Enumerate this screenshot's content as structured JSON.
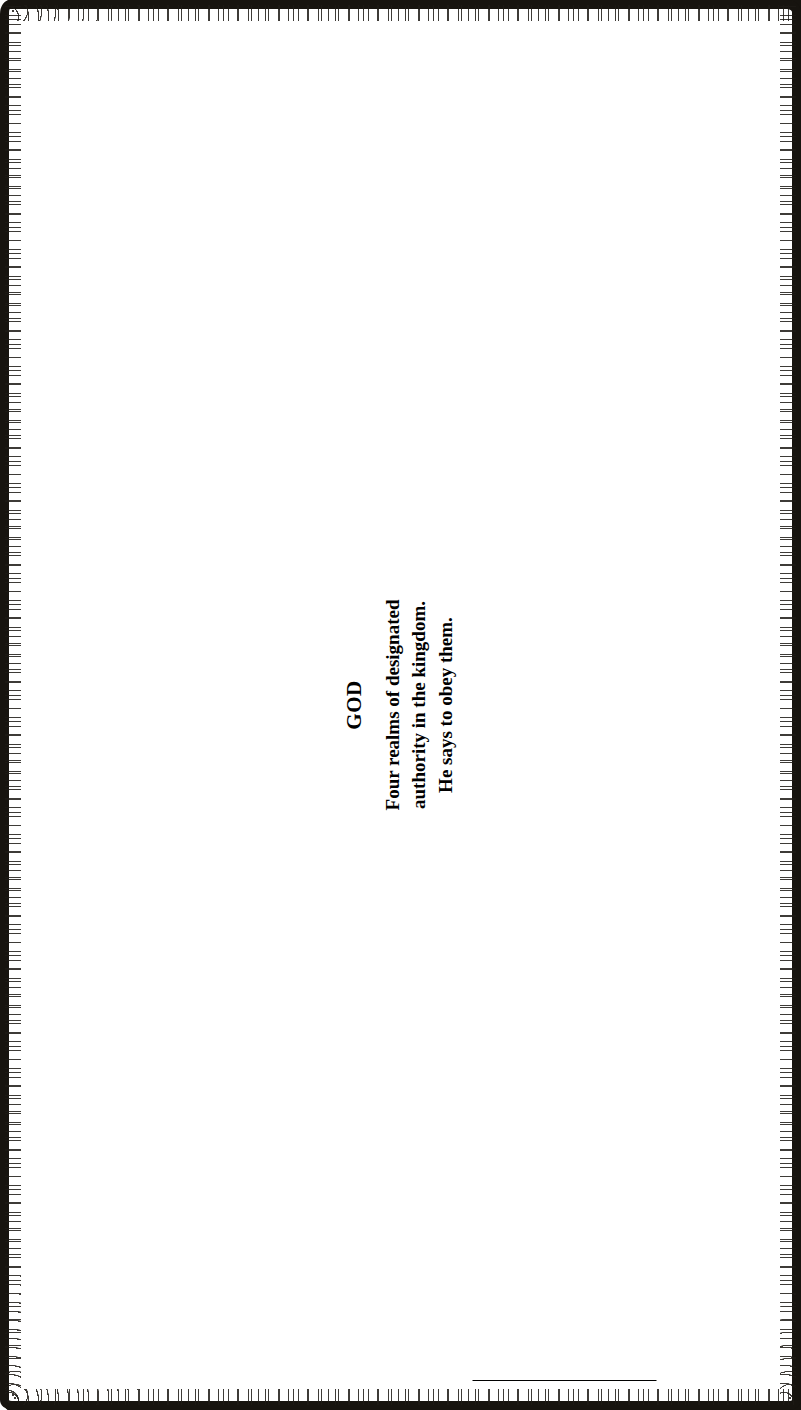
{
  "diagram": {
    "title": "Four Realms of Designated Authority",
    "orientation": "rotated-90-ccw",
    "source_type": "scanned book illustration",
    "ink_color": "#000000",
    "paper_color": "#ffffff"
  },
  "tablet": {
    "heading": "GOD",
    "lines": [
      "Four realms of designated",
      "authority in the kingdom.",
      "He says to obey them."
    ]
  },
  "notes": {
    "acts": [
      "Acts 5:29 — Peter and",
      "other apostles replied,",
      "“We must obey God",
      "rather than men.”"
    ],
    "conflict": [
      "None of these conflict",
      "when you are under the",
      "right head."
    ]
  },
  "realms": [
    {
      "id": "civil",
      "label_head": "CIVIL",
      "label_sub": "Judges — Kings — President",
      "label_sub2": "Police",
      "box_lines": [
        "Those who are",
        "designated to rule",
        "politically over you.",
        "Daniel 1:8-9",
        "Romans 13",
        "Matthew 22:21"
      ]
    },
    {
      "id": "work",
      "label_head": "WORK",
      "label_sub": "Master — Employer",
      "label_sub2": "",
      "box_lines": [
        "YOU",
        "as",
        "servant or employee",
        "Colossians 4:1",
        "II Thessalonians 3:8",
        "Matthew 10:10"
      ]
    },
    {
      "id": "church",
      "label_head": "CHURCH",
      "label_sub": "Prophet — pastor — apostle",
      "label_sub2": "only in realm of ministry.",
      "box_lines": [
        "YOU",
        "as member",
        "Ephesians 4:11",
        "I Peter 5:2-3"
      ]
    },
    {
      "id": "home",
      "label_head": "HOME",
      "label_sub": "Husband — responsible to",
      "label_sub2": "protect and guard.",
      "box_lines": [
        "Wife",
        "Children",
        "Colossians 3:18, 19, 20",
        "Ephesians 5:22"
      ]
    }
  ]
}
